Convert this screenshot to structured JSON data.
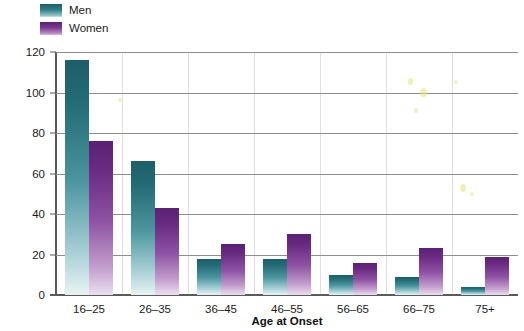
{
  "chart_data": {
    "type": "bar",
    "title": "",
    "xlabel": "Age at Onset",
    "ylabel": "Number of Individuals",
    "categories": [
      "16–25",
      "26–35",
      "36–45",
      "46–55",
      "56–65",
      "66–75",
      "75+"
    ],
    "series": [
      {
        "name": "Men",
        "color": "#1d5e68",
        "values": [
          116,
          66,
          18,
          18,
          10,
          9,
          4
        ]
      },
      {
        "name": "Women",
        "color": "#5a2172",
        "values": [
          76,
          43,
          25,
          30,
          16,
          23,
          19
        ]
      }
    ],
    "ylim": [
      0,
      120
    ],
    "yticks": [
      0,
      20,
      40,
      60,
      80,
      100,
      120
    ],
    "ytick_labels": [
      "0",
      "20",
      "40",
      "60",
      "80",
      "100",
      "120"
    ],
    "grid": true,
    "legend_position": "top-left"
  },
  "legend": {
    "items": [
      {
        "label": "Men",
        "swatch": "men-swatch"
      },
      {
        "label": "Women",
        "swatch": "women-swatch"
      }
    ]
  }
}
